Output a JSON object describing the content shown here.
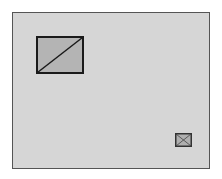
{
  "diagram": {
    "frame": {
      "fill": "#d6d6d6",
      "stroke": "#555555"
    },
    "large_placeholder": {
      "fill": "#b4b4b4",
      "stroke": "#1a1a1a",
      "glyph": "diagonal-slash"
    },
    "small_placeholder": {
      "fill": "#b0b0b0",
      "stroke": "#333333",
      "glyph": "cross-x"
    }
  }
}
